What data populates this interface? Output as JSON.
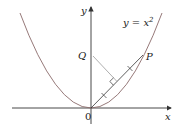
{
  "diagram": {
    "curve_label": "y = x",
    "curve_exponent": "2",
    "axis_x_label": "x",
    "axis_y_label": "y",
    "origin_label": "0",
    "point_P_label": "P",
    "point_Q_label": "Q"
  },
  "colors": {
    "curve": "#8a6a6a",
    "axes": "#333333",
    "segment": "#333333",
    "perpendicular": "#999999"
  }
}
